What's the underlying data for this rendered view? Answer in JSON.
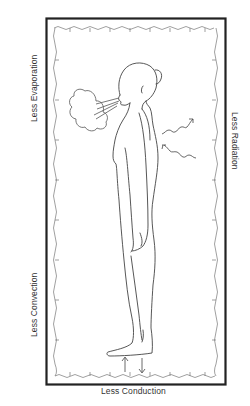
{
  "diagram": {
    "labels": {
      "evaporation": "Less Evaporation",
      "convection": "Less Convection",
      "radiation": "Less Radiation",
      "conduction": "Less Conduction"
    },
    "elements": {
      "outer_frame": "Thick rectangular border enclosure",
      "inner_blanket": "Wavy inner lining (blanket/bag)",
      "figure": "Standing human figure, side profile, facing left",
      "breath_cloud": "Exhaled breath cloud at mouth",
      "radiation_arrows": [
        "wavy arrow outward",
        "wavy arrow inward"
      ],
      "conduction_arrows": [
        "arrow up",
        "arrow down"
      ]
    },
    "colors": {
      "frame": "#222222",
      "lines": "#555555",
      "text": "#333333",
      "background": "#ffffff"
    }
  }
}
